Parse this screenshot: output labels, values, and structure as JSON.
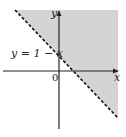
{
  "figure": {
    "type": "inequality-region-graph",
    "region": {
      "description": "Shaded half-plane above the line",
      "inequality": "y > 1 - x",
      "fill_color": "#d4d4d4"
    },
    "boundary_line": {
      "equation_label": "y = 1 − x",
      "style": "dashed",
      "color": "#111111"
    },
    "axes": {
      "x_label": "x",
      "y_label": "y",
      "origin_label": "0",
      "color": "#222222"
    }
  }
}
